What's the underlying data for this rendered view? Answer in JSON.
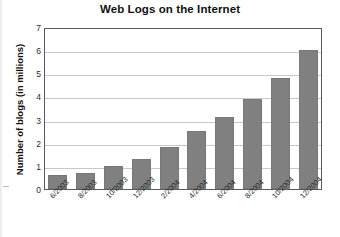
{
  "chart_data": {
    "type": "bar",
    "title": "Web Logs on the Internet",
    "xlabel": "",
    "ylabel": "Number of blogs (in millions)",
    "categories": [
      "6/2003",
      "8/2003",
      "10/2003",
      "12/2003",
      "2/2004",
      "4/2004",
      "6/2004",
      "8/2004",
      "10/2004",
      "12/2004"
    ],
    "values": [
      0.6,
      0.7,
      1.0,
      1.3,
      1.8,
      2.5,
      3.1,
      3.9,
      4.8,
      6.0
    ],
    "ylim": [
      0,
      7
    ],
    "yticks": [
      0,
      1,
      2,
      3,
      4,
      5,
      6,
      7
    ],
    "ytick_labels": [
      "0",
      "1",
      "2",
      "3",
      "4",
      "5",
      "6",
      "7"
    ],
    "grid": true,
    "legend": false,
    "bar_color": "#808080"
  }
}
